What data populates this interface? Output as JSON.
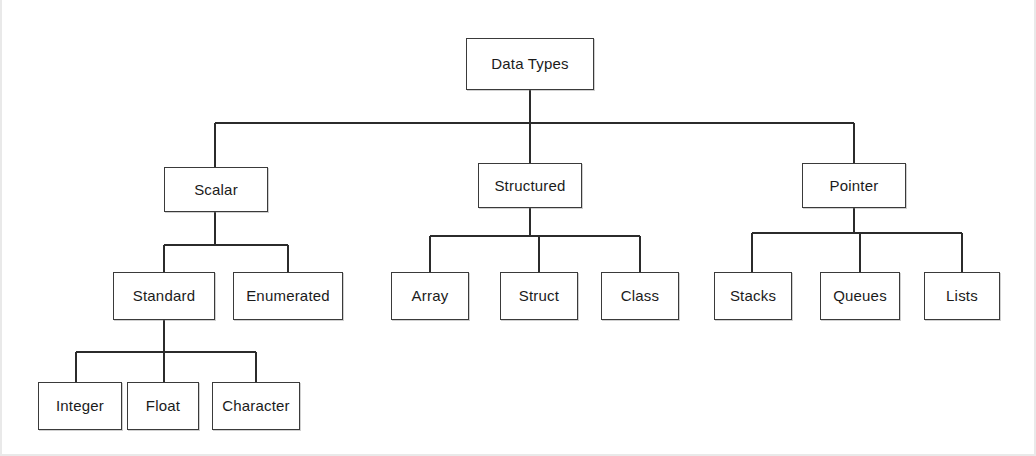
{
  "diagram": {
    "title": "Data Types",
    "type": "hierarchy-tree",
    "levels": 4,
    "colors": {
      "background": "#ffffff",
      "box_border": "#3a3a3a",
      "connector": "#2b2b2b",
      "text": "#1b1b1b"
    },
    "nodes": [
      {
        "id": "data-types",
        "label": "Data Types",
        "level": 0,
        "parent": null,
        "x": 466,
        "y": 38,
        "w": 128,
        "h": 52
      },
      {
        "id": "scalar",
        "label": "Scalar",
        "level": 1,
        "parent": "data-types",
        "x": 164,
        "y": 167,
        "w": 104,
        "h": 45
      },
      {
        "id": "structured",
        "label": "Structured",
        "level": 1,
        "parent": "data-types",
        "x": 478,
        "y": 163,
        "w": 104,
        "h": 45
      },
      {
        "id": "pointer",
        "label": "Pointer",
        "level": 1,
        "parent": "data-types",
        "x": 802,
        "y": 163,
        "w": 104,
        "h": 45
      },
      {
        "id": "standard",
        "label": "Standard",
        "level": 2,
        "parent": "scalar",
        "x": 113,
        "y": 272,
        "w": 102,
        "h": 48
      },
      {
        "id": "enumerated",
        "label": "Enumerated",
        "level": 2,
        "parent": "scalar",
        "x": 233,
        "y": 272,
        "w": 110,
        "h": 48
      },
      {
        "id": "array",
        "label": "Array",
        "level": 2,
        "parent": "structured",
        "x": 391,
        "y": 272,
        "w": 78,
        "h": 48
      },
      {
        "id": "struct",
        "label": "Struct",
        "level": 2,
        "parent": "structured",
        "x": 500,
        "y": 272,
        "w": 78,
        "h": 48
      },
      {
        "id": "class",
        "label": "Class",
        "level": 2,
        "parent": "structured",
        "x": 601,
        "y": 272,
        "w": 78,
        "h": 48
      },
      {
        "id": "stacks",
        "label": "Stacks",
        "level": 2,
        "parent": "pointer",
        "x": 714,
        "y": 272,
        "w": 78,
        "h": 48
      },
      {
        "id": "queues",
        "label": "Queues",
        "level": 2,
        "parent": "pointer",
        "x": 820,
        "y": 272,
        "w": 80,
        "h": 48
      },
      {
        "id": "lists",
        "label": "Lists",
        "level": 2,
        "parent": "pointer",
        "x": 924,
        "y": 272,
        "w": 76,
        "h": 48
      },
      {
        "id": "integer",
        "label": "Integer",
        "level": 3,
        "parent": "standard",
        "x": 38,
        "y": 382,
        "w": 84,
        "h": 48
      },
      {
        "id": "float",
        "label": "Float",
        "level": 3,
        "parent": "standard",
        "x": 127,
        "y": 382,
        "w": 72,
        "h": 48
      },
      {
        "id": "character",
        "label": "Character",
        "level": 3,
        "parent": "standard",
        "x": 212,
        "y": 382,
        "w": 88,
        "h": 48
      }
    ],
    "connectors": [
      {
        "name": "root-stem",
        "x1": 530,
        "y1": 90,
        "x2": 530,
        "y2": 123
      },
      {
        "name": "root-bus",
        "x1": 215,
        "y1": 123,
        "x2": 854,
        "y2": 123
      },
      {
        "name": "drop-scalar",
        "x1": 215,
        "y1": 123,
        "x2": 215,
        "y2": 167
      },
      {
        "name": "drop-structured",
        "x1": 530,
        "y1": 123,
        "x2": 530,
        "y2": 163
      },
      {
        "name": "drop-pointer",
        "x1": 854,
        "y1": 123,
        "x2": 854,
        "y2": 163
      },
      {
        "name": "scalar-stem",
        "x1": 215,
        "y1": 212,
        "x2": 215,
        "y2": 245
      },
      {
        "name": "scalar-bus",
        "x1": 164,
        "y1": 245,
        "x2": 288,
        "y2": 245
      },
      {
        "name": "drop-standard",
        "x1": 164,
        "y1": 245,
        "x2": 164,
        "y2": 272
      },
      {
        "name": "drop-enumerated",
        "x1": 288,
        "y1": 245,
        "x2": 288,
        "y2": 272
      },
      {
        "name": "structured-stem",
        "x1": 530,
        "y1": 208,
        "x2": 530,
        "y2": 236
      },
      {
        "name": "structured-bus",
        "x1": 430,
        "y1": 236,
        "x2": 640,
        "y2": 236
      },
      {
        "name": "drop-array",
        "x1": 430,
        "y1": 236,
        "x2": 430,
        "y2": 272
      },
      {
        "name": "drop-struct",
        "x1": 539,
        "y1": 236,
        "x2": 539,
        "y2": 272
      },
      {
        "name": "drop-class",
        "x1": 640,
        "y1": 236,
        "x2": 640,
        "y2": 272
      },
      {
        "name": "pointer-stem",
        "x1": 854,
        "y1": 208,
        "x2": 854,
        "y2": 233
      },
      {
        "name": "pointer-bus",
        "x1": 752,
        "y1": 233,
        "x2": 962,
        "y2": 233
      },
      {
        "name": "drop-stacks",
        "x1": 752,
        "y1": 233,
        "x2": 752,
        "y2": 272
      },
      {
        "name": "drop-queues",
        "x1": 860,
        "y1": 233,
        "x2": 860,
        "y2": 272
      },
      {
        "name": "drop-lists",
        "x1": 962,
        "y1": 233,
        "x2": 962,
        "y2": 272
      },
      {
        "name": "standard-stem",
        "x1": 164,
        "y1": 320,
        "x2": 164,
        "y2": 382
      },
      {
        "name": "standard-bus",
        "x1": 76,
        "y1": 352,
        "x2": 256,
        "y2": 352
      },
      {
        "name": "drop-integer",
        "x1": 76,
        "y1": 352,
        "x2": 76,
        "y2": 382
      },
      {
        "name": "drop-character",
        "x1": 256,
        "y1": 352,
        "x2": 256,
        "y2": 382
      }
    ]
  }
}
